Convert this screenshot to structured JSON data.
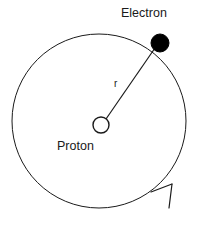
{
  "diagram": {
    "background_color": "#ffffff",
    "stroke_color": "#1a1a1a",
    "labels": {
      "electron": "Electron",
      "proton": "Proton",
      "radius": "r"
    },
    "orbit": {
      "shape": "circle",
      "center_x": 99,
      "center_y": 121,
      "radius": 87,
      "stroke_color": "#1a1a1a",
      "stroke_width": 1,
      "fill": "none"
    },
    "proton_marker": {
      "shape": "circle-outline",
      "center_x": 101,
      "center_y": 125,
      "radius": 8,
      "fill": "#ffffff",
      "stroke_color": "#1a1a1a",
      "stroke_width": 1.4
    },
    "electron_marker": {
      "shape": "circle-filled",
      "center_x": 160,
      "center_y": 43,
      "radius": 9,
      "fill": "#000000",
      "stroke_color": "#000000"
    },
    "radius_line": {
      "x1": 106,
      "y1": 119,
      "x2": 155,
      "y2": 48,
      "stroke_color": "#1a1a1a",
      "stroke_width": 1.2
    },
    "direction_arrow": {
      "description": "counter-clockwise orbit direction arrowhead on lower-right of orbit",
      "tip_x": 172,
      "tip_y": 184,
      "barb1_x": 151,
      "barb1_y": 192,
      "barb2_x": 169,
      "barb2_y": 208,
      "stroke_color": "#1a1a1a",
      "stroke_width": 1.2
    }
  }
}
